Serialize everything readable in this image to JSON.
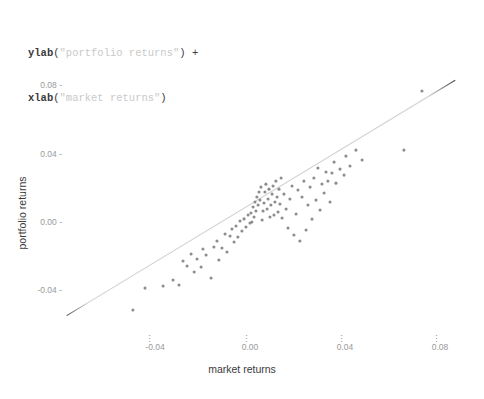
{
  "code": {
    "line1": {
      "fn": "ylab",
      "open": "(",
      "string": "\"portfolio returns\"",
      "close": ")",
      "plus": " +"
    },
    "line2": {
      "fn": "xlab",
      "open": "(",
      "string": "\"market returns\"",
      "close": ")",
      "plus": ""
    }
  },
  "colors": {
    "point": "#8d8d8d",
    "line": "#d0d0d0",
    "line_tip": "#4a4a4a",
    "tick_text": "#9a9a9a",
    "axis_title": "#3a3a3a",
    "code_fn": "#3b3b3b",
    "code_string": "#c9c9c9",
    "background": "#ffffff"
  },
  "chart_data": {
    "type": "scatter",
    "title": "",
    "xlabel": "market returns",
    "ylabel": "portfolio returns",
    "xlim": [
      -0.079,
      0.0855
    ],
    "ylim": [
      -0.0585,
      0.0915
    ],
    "xticks": [
      -0.04,
      0.0,
      0.04,
      0.08
    ],
    "xtick_labels": [
      "-0.04",
      "0.00",
      "0.04",
      "0.08"
    ],
    "yticks": [
      -0.04,
      0.0,
      0.04,
      0.08
    ],
    "ytick_labels": [
      "-0.04",
      "0.00",
      "0.04",
      "0.08"
    ],
    "grid": false,
    "legend": false,
    "point_size": 3.1,
    "series": [
      {
        "name": "returns",
        "x": [
          -0.0493,
          -0.0442,
          -0.0366,
          -0.0324,
          -0.0299,
          -0.0282,
          -0.0265,
          -0.0248,
          -0.0235,
          -0.0223,
          -0.0206,
          -0.0198,
          -0.0185,
          -0.0164,
          -0.0152,
          -0.0139,
          -0.0131,
          -0.0118,
          -0.0105,
          -0.0097,
          -0.0084,
          -0.0076,
          -0.0067,
          -0.0059,
          -0.0051,
          -0.0042,
          -0.0034,
          -0.0025,
          -0.0017,
          -0.0008,
          0.0,
          0.0004,
          0.0008,
          0.0013,
          0.0017,
          0.0021,
          0.0025,
          0.0029,
          0.0034,
          0.0038,
          0.0042,
          0.0046,
          0.0051,
          0.0055,
          0.0059,
          0.0063,
          0.0067,
          0.0072,
          0.0076,
          0.008,
          0.0084,
          0.0088,
          0.0093,
          0.0097,
          0.0101,
          0.0105,
          0.0109,
          0.0114,
          0.0118,
          0.0122,
          0.0126,
          0.0131,
          0.0135,
          0.0143,
          0.0152,
          0.016,
          0.0168,
          0.0177,
          0.0185,
          0.0194,
          0.0202,
          0.021,
          0.0219,
          0.0227,
          0.0236,
          0.0244,
          0.0253,
          0.0261,
          0.0269,
          0.0278,
          0.0286,
          0.0295,
          0.0303,
          0.0312,
          0.032,
          0.0328,
          0.0337,
          0.0345,
          0.0354,
          0.0362,
          0.0379,
          0.0396,
          0.0404,
          0.0421,
          0.0446,
          0.0472,
          0.0648,
          0.0724
        ],
        "y": [
          -0.0514,
          -0.0386,
          -0.0374,
          -0.0339,
          -0.0368,
          -0.0228,
          -0.0257,
          -0.0187,
          -0.0292,
          -0.0216,
          -0.0263,
          -0.0158,
          -0.0193,
          -0.0327,
          -0.0146,
          -0.0111,
          -0.0222,
          -0.0152,
          -0.007,
          -0.0175,
          -0.0082,
          -0.0041,
          -0.0117,
          -0.0023,
          -0.0088,
          0.0006,
          -0.0053,
          0.0018,
          -0.0029,
          0.0041,
          -0.0006,
          0.0053,
          0.0,
          0.0088,
          0.0029,
          0.0117,
          0.0064,
          0.0146,
          0.0099,
          0.0175,
          0.0128,
          0.0204,
          0.0012,
          0.0064,
          0.0111,
          0.0175,
          0.0221,
          0.0076,
          0.0134,
          0.0192,
          0.0029,
          0.0099,
          0.0163,
          0.021,
          0.0041,
          0.0117,
          0.0239,
          0.0146,
          0.0058,
          0.0192,
          0.0105,
          0.0257,
          0.0023,
          0.0163,
          0.0076,
          -0.0035,
          0.0134,
          0.021,
          -0.0076,
          0.0047,
          0.0187,
          -0.0111,
          0.0146,
          0.0239,
          -0.0047,
          0.0099,
          0.0204,
          0.0017,
          0.0257,
          0.0128,
          0.0315,
          0.007,
          0.0222,
          0.0169,
          0.0292,
          0.0239,
          0.0117,
          0.0286,
          0.035,
          0.0227,
          0.0309,
          0.0274,
          0.0385,
          0.0327,
          0.042,
          0.0362,
          0.042,
          0.0765
        ]
      }
    ],
    "trend_line": {
      "name": "fit",
      "x_start": -0.0772,
      "y_start": -0.0547,
      "x_end": 0.0864,
      "y_end": 0.0828
    }
  }
}
